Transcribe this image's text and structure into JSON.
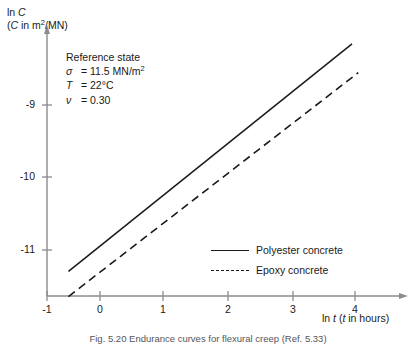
{
  "chart_data": {
    "type": "line",
    "title": "",
    "xlabel": "ln t (t in hours)",
    "xlabel_parts": {
      "prefix": "ln ",
      "var1": "t",
      "mid": " (",
      "var2": "t",
      "suffix": " in hours)"
    },
    "ylabel": "ln C (C in m2/MN)",
    "ylabel_line1_prefix": "ln ",
    "ylabel_line1_var": "C",
    "ylabel_line2_open": "(",
    "ylabel_line2_var": "C",
    "ylabel_line2_rest": " in m",
    "ylabel_line2_sup": "2",
    "ylabel_line2_tail": "/MN)",
    "xlim": [
      -1,
      4.6
    ],
    "ylim": [
      -11.75,
      -8.0
    ],
    "xticks": [
      -1,
      0,
      1,
      2,
      3,
      4
    ],
    "xticklabels": [
      "-1",
      "0",
      "1",
      "2",
      "3",
      "4"
    ],
    "yticks": [
      -9,
      -10,
      -11
    ],
    "yticklabels": [
      "-9",
      "-10",
      "-11"
    ],
    "grid": false,
    "legend_position": "inside-lower-right",
    "series": [
      {
        "name": "Polyester concrete",
        "style": "solid",
        "color": "#1a1a1a",
        "x": [
          -0.5,
          4.0
        ],
        "y": [
          -11.31,
          -8.15
        ]
      },
      {
        "name": "Epoxy concrete",
        "style": "dashed",
        "color": "#1a1a1a",
        "x": [
          -0.5,
          4.1
        ],
        "y": [
          -11.66,
          -8.55
        ]
      }
    ],
    "annotation": {
      "title": "Reference state",
      "rows": [
        {
          "symbol": "σ",
          "equals": "=",
          "value": "11.5 MN/m",
          "sup": "2"
        },
        {
          "symbol": "T",
          "equals": "=",
          "value": "22°C",
          "sup": ""
        },
        {
          "symbol": "ν",
          "equals": "=",
          "value": "0.30",
          "sup": ""
        }
      ]
    }
  },
  "legend": {
    "items": [
      {
        "label": "Polyester concrete",
        "style": "solid"
      },
      {
        "label": "Epoxy concrete",
        "style": "dashed"
      }
    ]
  },
  "caption": {
    "text": "Fig. 5.20  Endurance curves for flexural creep (Ref. 5.33)"
  }
}
